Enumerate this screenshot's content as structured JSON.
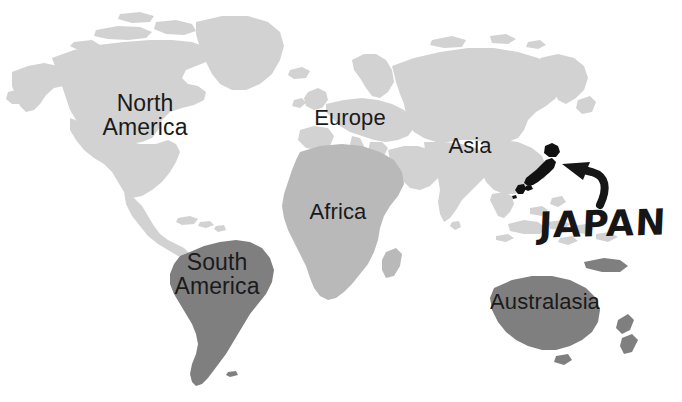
{
  "figure": {
    "background_color": "#ffffff",
    "width": 682,
    "height": 402
  },
  "palette": {
    "land_light": "#d2d2d2",
    "land_medium": "#b9b9b9",
    "land_dark": "#7f7f7f",
    "highlight": "#111111",
    "label_text": "#1a1a1a",
    "background": "#ffffff"
  },
  "labels": {
    "north_america": "North\nAmerica",
    "europe": "Europe",
    "asia": "Asia",
    "africa": "Africa",
    "south_america": "South\nAmerica",
    "australasia": "Australasia",
    "japan": "JAPAN"
  },
  "annotation": {
    "callout_text": "JAPAN",
    "arrow": "curved-arrow-pointing-to-japan",
    "highlighted_country": "Japan",
    "highlight_color": "#111111"
  },
  "regions": [
    {
      "name": "North America",
      "shade": "#d2d2d2",
      "label": "North America"
    },
    {
      "name": "Europe",
      "shade": "#d2d2d2",
      "label": "Europe"
    },
    {
      "name": "Asia",
      "shade": "#d2d2d2",
      "label": "Asia"
    },
    {
      "name": "Africa",
      "shade": "#b9b9b9",
      "label": "Africa"
    },
    {
      "name": "South America",
      "shade": "#7f7f7f",
      "label": "South America"
    },
    {
      "name": "Australasia",
      "shade": "#7f7f7f",
      "label": "Australasia"
    },
    {
      "name": "Japan",
      "shade": "#111111",
      "label": "JAPAN"
    }
  ]
}
